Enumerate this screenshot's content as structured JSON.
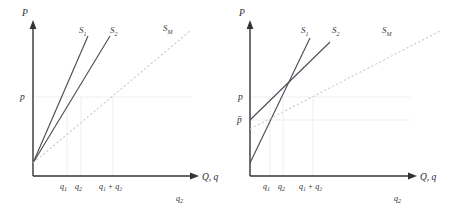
{
  "figure": {
    "type": "diagram",
    "panels": [
      {
        "id": "left",
        "axes": {
          "y_label": "P",
          "x_label": "Q, q",
          "origin_px": [
            33,
            176
          ]
        },
        "price_marks": [
          {
            "label": "p",
            "y_px": 97
          }
        ],
        "x_ticks": [
          {
            "label": "q",
            "sub": "1",
            "x_px": 67
          },
          {
            "label": "q",
            "sub": "2",
            "x_px": 81
          },
          {
            "label": "q₁ + q₂",
            "x_px": 113
          }
        ],
        "extra_label": {
          "text": "q",
          "sub": "2",
          "x_px": 180,
          "y_px": 200
        },
        "curves": [
          {
            "name": "S",
            "sub": "1",
            "style": "solid",
            "x1": 33,
            "y1": 163,
            "x2": 88,
            "y2": 36,
            "label_x": 79,
            "label_y": 33
          },
          {
            "name": "S",
            "sub": "2",
            "style": "solid",
            "x1": 33,
            "y1": 163,
            "x2": 110,
            "y2": 36,
            "label_x": 110,
            "label_y": 33
          },
          {
            "name": "S",
            "sub": "M",
            "style": "dashed",
            "x1": 33,
            "y1": 163,
            "x2": 190,
            "y2": 31,
            "label_x": 163,
            "label_y": 31
          }
        ]
      },
      {
        "id": "right",
        "axes": {
          "y_label": "P",
          "x_label": "Q, q",
          "origin_px": [
            25,
            176
          ]
        },
        "price_marks": [
          {
            "label": "p",
            "y_px": 97
          },
          {
            "label": "p̄",
            "y_px": 120
          }
        ],
        "x_ticks": [
          {
            "label": "q",
            "sub": "1",
            "x_px": 67
          },
          {
            "label": "q",
            "sub": "2",
            "x_px": 81
          },
          {
            "label": "q₁ + q₂",
            "x_px": 113
          }
        ],
        "extra_label": {
          "text": "q",
          "sub": "2",
          "x_px": 180,
          "y_px": 200
        },
        "curves": [
          {
            "name": "S",
            "sub": "1",
            "style": "solid",
            "x1": 25,
            "y1": 163,
            "x2": 85,
            "y2": 38,
            "label_x": 76,
            "label_y": 33
          },
          {
            "name": "S",
            "sub": "2",
            "style": "solid",
            "x1": 25,
            "y1": 120,
            "x2": 105,
            "y2": 42,
            "label_x": 107,
            "label_y": 33
          },
          {
            "name": "S",
            "sub": "M",
            "style": "dashed",
            "x1": 25,
            "y1": 129,
            "x2": 215,
            "y2": 31,
            "label_x": 157,
            "label_y": 33
          }
        ],
        "intersection_px": [
          58,
          80
        ]
      }
    ]
  }
}
